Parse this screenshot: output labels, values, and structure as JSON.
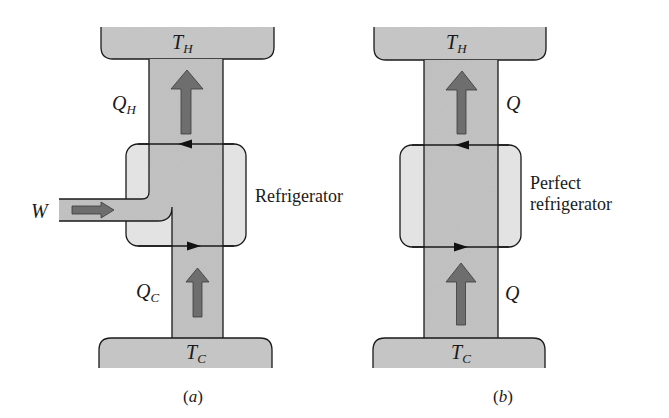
{
  "colors": {
    "reservoir_fill": "#c9c9c9",
    "column_fill": "#c4c4c4",
    "device_fill": "#e3e3e3",
    "arrow_fill": "#6e6e6e",
    "line": "#1a1a1a"
  },
  "panel_a": {
    "hot_reservoir": {
      "symbol": "T",
      "subscript": "H"
    },
    "cold_reservoir": {
      "symbol": "T",
      "subscript": "C"
    },
    "heat_out": {
      "symbol": "Q",
      "subscript": "H"
    },
    "heat_in": {
      "symbol": "Q",
      "subscript": "C"
    },
    "work_in": {
      "symbol": "W"
    },
    "device_label": "Refrigerator",
    "caption_open": "(",
    "caption_letter": "a",
    "caption_close": ")"
  },
  "panel_b": {
    "hot_reservoir": {
      "symbol": "T",
      "subscript": "H"
    },
    "cold_reservoir": {
      "symbol": "T",
      "subscript": "C"
    },
    "heat_out": {
      "symbol": "Q"
    },
    "heat_in": {
      "symbol": "Q"
    },
    "device_label_line1": "Perfect",
    "device_label_line2": "refrigerator",
    "caption_open": "(",
    "caption_letter": "b",
    "caption_close": ")"
  }
}
